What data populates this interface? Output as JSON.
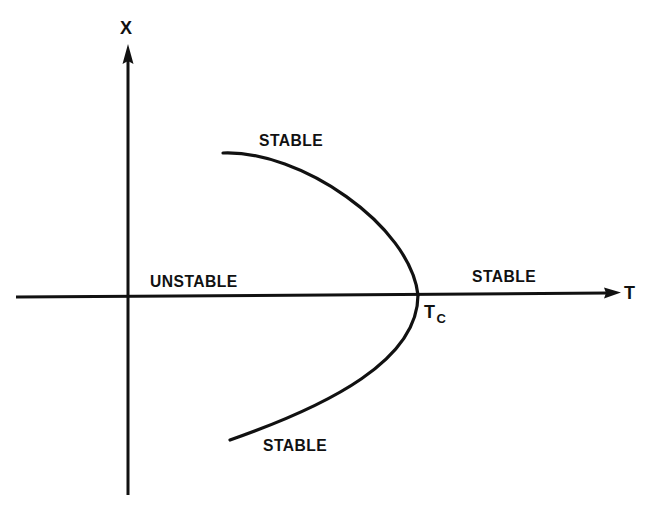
{
  "diagram": {
    "type": "bifurcation-diagram",
    "colors": {
      "ink": "#111111",
      "background": "#ffffff"
    },
    "axes": {
      "horizontal": {
        "label": "T"
      },
      "vertical": {
        "label": "X"
      }
    },
    "critical_point": {
      "label": "T",
      "subscript": "C"
    },
    "regions": {
      "upper_branch": "STABLE",
      "lower_branch": "STABLE",
      "axis_before_critical": "UNSTABLE",
      "axis_after_critical": "STABLE"
    }
  }
}
